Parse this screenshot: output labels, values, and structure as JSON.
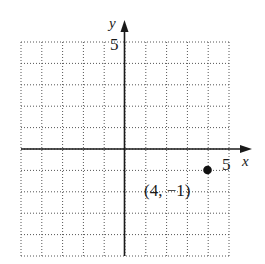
{
  "chart_data": {
    "type": "scatter",
    "title": "",
    "xlabel": "x",
    "ylabel": "y",
    "xlim": [
      -5,
      5
    ],
    "ylim": [
      -5,
      5
    ],
    "grid": true,
    "grid_style": "dotted",
    "tick_labels": {
      "x": [
        "5"
      ],
      "y": [
        "5"
      ]
    },
    "points": [
      {
        "x": 4,
        "y": -1,
        "label": "(4, −1)"
      }
    ]
  },
  "labels": {
    "x_axis": "x",
    "y_axis": "y",
    "x_tick_5": "5",
    "y_tick_5": "5",
    "point_label": "(4, −1)"
  },
  "colors": {
    "axis": "#1a1a1a",
    "grid": "#555555",
    "point": "#111111"
  }
}
